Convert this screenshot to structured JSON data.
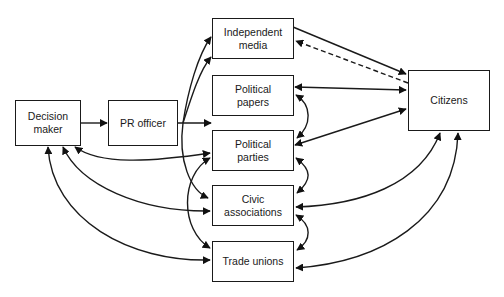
{
  "diagram": {
    "type": "flow-network",
    "nodes": [
      {
        "id": "decision_maker",
        "label_lines": [
          "Decision",
          "maker"
        ]
      },
      {
        "id": "pr_officer",
        "label_lines": [
          "PR officer"
        ]
      },
      {
        "id": "independent_media",
        "label_lines": [
          "Independent",
          "media"
        ]
      },
      {
        "id": "political_papers",
        "label_lines": [
          "Political",
          "papers"
        ]
      },
      {
        "id": "political_parties",
        "label_lines": [
          "Political",
          "parties"
        ]
      },
      {
        "id": "civic_associations",
        "label_lines": [
          "Civic",
          "associations"
        ]
      },
      {
        "id": "trade_unions",
        "label_lines": [
          "Trade unions"
        ]
      },
      {
        "id": "citizens",
        "label_lines": [
          "Citizens"
        ]
      }
    ],
    "edges": [
      {
        "from": "decision_maker",
        "to": "pr_officer",
        "style": "solid",
        "direction": "one-way"
      },
      {
        "from": "pr_officer",
        "to": "independent_media",
        "style": "solid",
        "direction": "one-way"
      },
      {
        "from": "pr_officer",
        "to": "political_papers",
        "style": "solid",
        "direction": "one-way"
      },
      {
        "from": "pr_officer",
        "to": "civic_associations",
        "style": "solid",
        "direction": "one-way"
      },
      {
        "from": "independent_media",
        "to": "citizens",
        "style": "solid",
        "direction": "one-way"
      },
      {
        "from": "citizens",
        "to": "independent_media",
        "style": "dashed",
        "direction": "one-way"
      },
      {
        "from": "political_papers",
        "to": "citizens",
        "style": "solid",
        "direction": "two-way"
      },
      {
        "from": "political_parties",
        "to": "citizens",
        "style": "solid",
        "direction": "two-way"
      },
      {
        "from": "civic_associations",
        "to": "citizens",
        "style": "solid",
        "direction": "two-way"
      },
      {
        "from": "trade_unions",
        "to": "citizens",
        "style": "solid",
        "direction": "two-way"
      },
      {
        "from": "political_papers",
        "to": "political_parties",
        "style": "solid",
        "direction": "two-way"
      },
      {
        "from": "political_parties",
        "to": "civic_associations",
        "style": "solid",
        "direction": "two-way"
      },
      {
        "from": "civic_associations",
        "to": "trade_unions",
        "style": "solid",
        "direction": "two-way"
      },
      {
        "from": "political_parties",
        "to": "trade_unions",
        "style": "solid",
        "direction": "two-way"
      },
      {
        "from": "decision_maker",
        "to": "political_parties",
        "style": "solid",
        "direction": "two-way"
      },
      {
        "from": "decision_maker",
        "to": "civic_associations",
        "style": "solid",
        "direction": "two-way"
      },
      {
        "from": "decision_maker",
        "to": "trade_unions",
        "style": "solid",
        "direction": "two-way"
      }
    ],
    "colors": {
      "stroke": "#1a1a1a",
      "background": "#ffffff"
    }
  }
}
